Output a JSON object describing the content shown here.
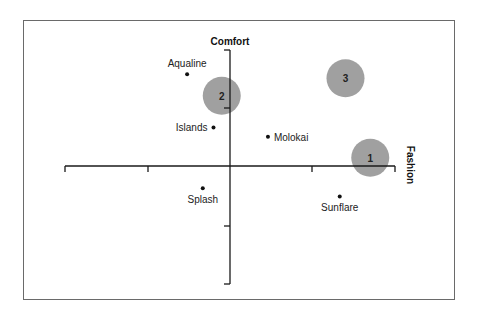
{
  "chart_data": {
    "type": "scatter",
    "title": "",
    "xlabel": "Fashion",
    "ylabel": "Comfort",
    "xlim": [
      -2,
      2
    ],
    "ylim": [
      -2,
      2
    ],
    "grid": false,
    "legend": null,
    "x_ticks": [
      -2,
      -1,
      0,
      1,
      2
    ],
    "y_ticks": [
      -2,
      -1,
      0,
      1,
      2
    ],
    "brands": [
      {
        "name": "Aqualine",
        "x": -0.52,
        "y": 1.57,
        "label_pos": "above"
      },
      {
        "name": "Islands",
        "x": -0.2,
        "y": 0.66,
        "label_pos": "left"
      },
      {
        "name": "Molokai",
        "x": 0.46,
        "y": 0.5,
        "label_pos": "right"
      },
      {
        "name": "Splash",
        "x": -0.33,
        "y": -0.38,
        "label_pos": "below"
      },
      {
        "name": "Sunflare",
        "x": 1.33,
        "y": -0.52,
        "label_pos": "below"
      }
    ],
    "segments": [
      {
        "label": "1",
        "x": 1.7,
        "y": 0.14
      },
      {
        "label": "2",
        "x": -0.1,
        "y": 1.2
      },
      {
        "label": "3",
        "x": 1.4,
        "y": 1.5
      }
    ]
  },
  "axes": {
    "x_title": "Fashion",
    "y_title": "Comfort"
  },
  "colors": {
    "bubble": "#a0a0a0",
    "axis": "#1a1a1a",
    "frame": "#6a6a6a"
  }
}
